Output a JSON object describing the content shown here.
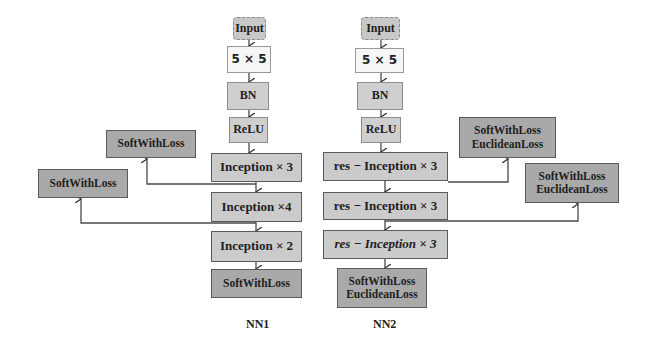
{
  "diagram": {
    "nn1": {
      "label": "NN1",
      "layers": [
        "Input",
        "5 × 5",
        "BN",
        "ReLU",
        "Inception × 3",
        "Inception ×4",
        "Inception × 2",
        "SoftWithLoss"
      ],
      "aux_outputs": [
        {
          "label": "SoftWithLoss",
          "from": "Inception × 3"
        },
        {
          "label": "SoftWithLoss",
          "from": "Inception ×4"
        }
      ]
    },
    "nn2": {
      "label": "NN2",
      "layers": [
        "Input",
        "5 × 5",
        "BN",
        "ReLU",
        "res − Inception × 3",
        "res − Inception × 3",
        "res − Inception × 3"
      ],
      "final_output": {
        "line1": "SoftWithLoss",
        "line2": "EuclideanLoss"
      },
      "aux_outputs": [
        {
          "line1": "SoftWithLoss",
          "line2": "EuclideanLoss",
          "from": "res − Inception × 3 (1)"
        },
        {
          "line1": "SoftWithLoss",
          "line2": "EuclideanLoss",
          "from": "res − Inception × 3 (2)"
        }
      ]
    },
    "colors": {
      "dark_box": "#a9a9a9",
      "mid_box": "#cbcbcb",
      "light_box": "#f6f6f6",
      "line": "#4a4a4a"
    }
  }
}
